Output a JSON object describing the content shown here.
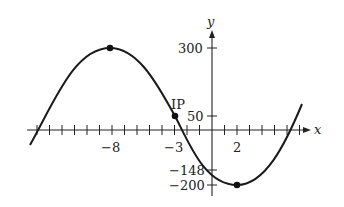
{
  "chart_data": {
    "type": "line",
    "title": "",
    "xlabel": "x",
    "ylabel": "y",
    "curve": "sinusoid",
    "xlim": [
      -14.5,
      7.7
    ],
    "ylim": [
      -220,
      330
    ],
    "x_tick_labels": [
      "-8",
      "-3",
      "2"
    ],
    "x_tick_values": [
      -8,
      -3,
      2
    ],
    "x_minor_ticks": [
      -14,
      -13,
      -12,
      -11,
      -10,
      -9,
      -8,
      -7,
      -6,
      -5,
      -4,
      -3,
      -2,
      -1,
      1,
      2,
      3,
      4,
      5,
      6,
      7
    ],
    "y_tick_labels": [
      "300",
      "50",
      "-148",
      "-200"
    ],
    "y_tick_values": [
      300,
      50,
      -148,
      -200
    ],
    "points": [
      {
        "label": "",
        "x": -8,
        "y": 300,
        "kind": "maximum"
      },
      {
        "label": "IP",
        "x": -3,
        "y": 50,
        "kind": "inflection point"
      },
      {
        "label": "",
        "x": 2,
        "y": -200,
        "kind": "minimum"
      },
      {
        "label": "",
        "x": 0,
        "y": -148,
        "kind": "y-intercept"
      }
    ],
    "series": [
      {
        "name": "f(x)",
        "x": [
          -14.5,
          -14,
          -12,
          -10,
          -8,
          -6,
          -4,
          -3,
          -2,
          0,
          2,
          4,
          6,
          7,
          7.2
        ],
        "y": [
          -55,
          -8,
          175,
          273,
          300,
          245,
          113,
          50,
          -13,
          -148,
          -200,
          -148,
          -13,
          85,
          100
        ]
      }
    ],
    "grid": false,
    "legend": null
  },
  "labels": {
    "x_axis": "x",
    "y_axis": "y",
    "tick_neg8": "−8",
    "tick_neg3": "−3",
    "tick_2": "2",
    "tick_300": "300",
    "tick_50": "50",
    "tick_neg148": "−148",
    "tick_neg200": "−200",
    "ip": "IP"
  }
}
